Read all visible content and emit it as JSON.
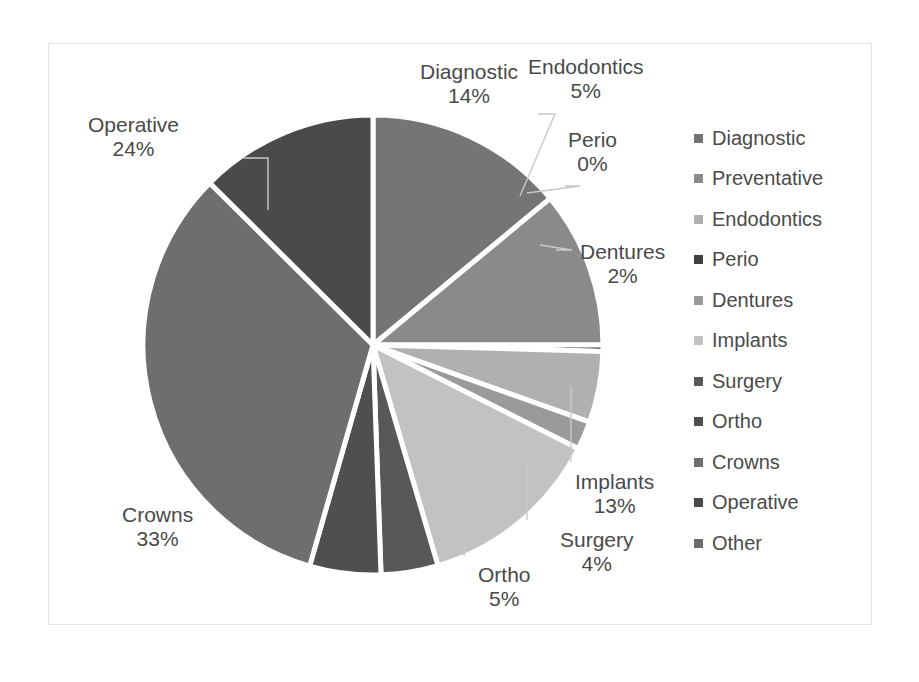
{
  "chart_data": {
    "type": "pie",
    "title": "",
    "subtitle": "",
    "xlabel": "",
    "ylabel": "",
    "grid": false,
    "legend_position": "right",
    "categories": [
      "Diagnostic",
      "Preventative",
      "Endodontics",
      "Perio",
      "Dentures",
      "Implants",
      "Surgery",
      "Ortho",
      "Crowns",
      "Operative",
      "Other"
    ],
    "values": [
      14,
      11,
      5,
      0,
      2,
      13,
      4,
      5,
      33,
      24,
      0
    ],
    "value_suffix": "%",
    "slice_order_clockwise_from_top": [
      "Diagnostic",
      "Preventative",
      "Perio",
      "Endodontics",
      "Dentures",
      "Implants",
      "Surgery",
      "Ortho",
      "Crowns",
      "Operative"
    ],
    "colors": [
      "#757575",
      "#8a8a8a",
      "#b0b0b0",
      "#3f3f3f",
      "#9a9a9a",
      "#c2c2c2",
      "#585858",
      "#4f4f4f",
      "#6e6e6e",
      "#4a4a4a",
      "#6b6b6b"
    ],
    "slices": [
      {
        "name": "Diagnostic",
        "value": 14,
        "color": "#757575",
        "start_deg": 0,
        "sweep_deg": 50.4,
        "labeled": true
      },
      {
        "name": "Preventative",
        "value": 11,
        "color": "#8a8a8a",
        "start_deg": 50.4,
        "sweep_deg": 39.6,
        "labeled": false
      },
      {
        "name": "Perio",
        "value": 0,
        "color": "#3f3f3f",
        "start_deg": 90.0,
        "sweep_deg": 1.6,
        "labeled": true
      },
      {
        "name": "Endodontics",
        "value": 5,
        "color": "#b0b0b0",
        "start_deg": 91.6,
        "sweep_deg": 18.0,
        "labeled": true
      },
      {
        "name": "Dentures",
        "value": 2,
        "color": "#9a9a9a",
        "start_deg": 109.6,
        "sweep_deg": 7.2,
        "labeled": true
      },
      {
        "name": "Implants",
        "value": 13,
        "color": "#c2c2c2",
        "start_deg": 116.8,
        "sweep_deg": 46.8,
        "labeled": true
      },
      {
        "name": "Surgery",
        "value": 4,
        "color": "#585858",
        "start_deg": 163.6,
        "sweep_deg": 14.4,
        "labeled": true
      },
      {
        "name": "Ortho",
        "value": 5,
        "color": "#4f4f4f",
        "start_deg": 178.0,
        "sweep_deg": 18.0,
        "labeled": true
      },
      {
        "name": "Crowns",
        "value": 33,
        "color": "#6e6e6e",
        "start_deg": 196.0,
        "sweep_deg": 118.8,
        "labeled": true
      },
      {
        "name": "Operative",
        "value": 24,
        "color": "#4a4a4a",
        "start_deg": 314.8,
        "sweep_deg": 45.2,
        "labeled": true
      }
    ]
  },
  "labels": [
    {
      "name": "Diagnostic",
      "pct": "14%",
      "left": 420,
      "top": 60
    },
    {
      "name": "Endodontics",
      "pct": "5%",
      "left": 528,
      "top": 55
    },
    {
      "name": "Perio",
      "pct": "0%",
      "left": 568,
      "top": 128
    },
    {
      "name": "Dentures",
      "pct": "2%",
      "left": 580,
      "top": 240
    },
    {
      "name": "Implants",
      "pct": "13%",
      "left": 575,
      "top": 470
    },
    {
      "name": "Surgery",
      "pct": "4%",
      "left": 560,
      "top": 528
    },
    {
      "name": "Ortho",
      "pct": "5%",
      "left": 478,
      "top": 563
    },
    {
      "name": "Crowns",
      "pct": "33%",
      "left": 122,
      "top": 503
    },
    {
      "name": "Operative",
      "pct": "24%",
      "left": 88,
      "top": 113
    }
  ],
  "legend": {
    "items": [
      {
        "label": "Diagnostic",
        "color": "#757575"
      },
      {
        "label": "Preventative",
        "color": "#8a8a8a"
      },
      {
        "label": "Endodontics",
        "color": "#b0b0b0"
      },
      {
        "label": "Perio",
        "color": "#3f3f3f"
      },
      {
        "label": "Dentures",
        "color": "#9a9a9a"
      },
      {
        "label": "Implants",
        "color": "#c2c2c2"
      },
      {
        "label": "Surgery",
        "color": "#585858"
      },
      {
        "label": "Ortho",
        "color": "#4f4f4f"
      },
      {
        "label": "Crowns",
        "color": "#6e6e6e"
      },
      {
        "label": "Operative",
        "color": "#4a4a4a"
      },
      {
        "label": "Other",
        "color": "#6b6b6b"
      }
    ]
  },
  "geometry": {
    "center_x": 373,
    "center_y": 345,
    "radius": 230
  }
}
